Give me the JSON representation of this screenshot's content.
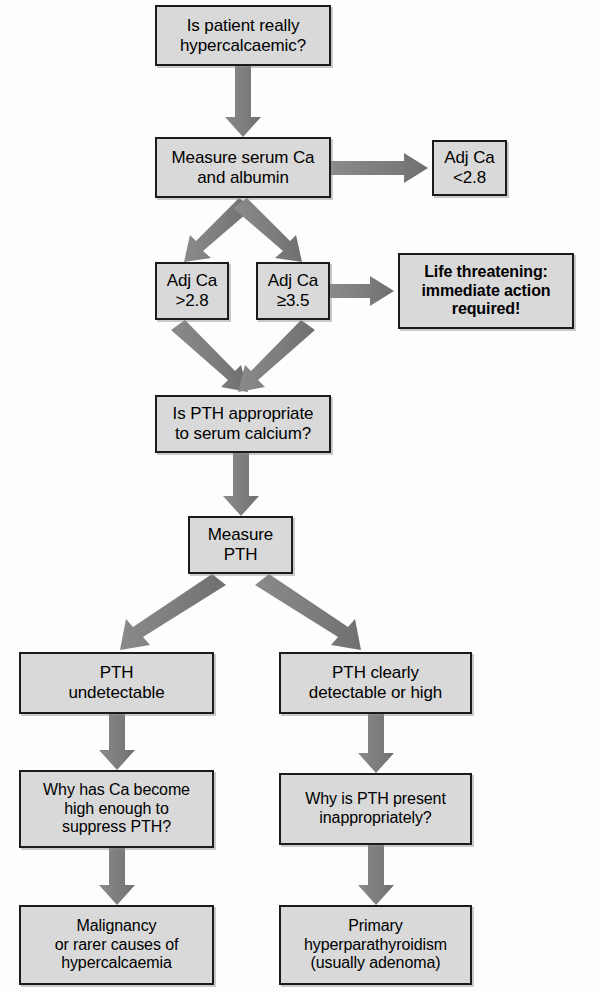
{
  "diagram": {
    "colors": {
      "box_fill": "#d9d9d9",
      "box_border": "#1b1b1b",
      "arrow": "#7d7d7d",
      "text": "#000000",
      "background": "#fdfdfd"
    },
    "nodes": [
      {
        "id": "is-patient-hypercalcaemic",
        "label": "Is patient really\nhypercalcaemic?",
        "bold": false,
        "x": 155,
        "y": 5,
        "w": 176,
        "h": 61,
        "font_size": 17
      },
      {
        "id": "measure-serum-ca-albumin",
        "label": "Measure serum Ca\nand albumin",
        "bold": false,
        "x": 155,
        "y": 137,
        "w": 176,
        "h": 61,
        "font_size": 17
      },
      {
        "id": "adj-ca-lt-2-8",
        "label": "Adj Ca\n<2.8",
        "bold": false,
        "x": 432,
        "y": 140,
        "w": 75,
        "h": 56,
        "font_size": 17
      },
      {
        "id": "adj-ca-gt-2-8",
        "label": "Adj Ca\n>2.8",
        "bold": false,
        "x": 155,
        "y": 262,
        "w": 74,
        "h": 58,
        "font_size": 17
      },
      {
        "id": "adj-ca-gte-3-5",
        "label": "Adj Ca\n≥3.5",
        "bold": false,
        "x": 256,
        "y": 262,
        "w": 74,
        "h": 58,
        "font_size": 17
      },
      {
        "id": "life-threatening",
        "label": "Life threatening:\nimmediate action\nrequired!",
        "bold": true,
        "x": 398,
        "y": 253,
        "w": 176,
        "h": 76,
        "font_size": 16
      },
      {
        "id": "is-pth-appropriate",
        "label": "Is PTH appropriate\nto serum calcium?",
        "bold": false,
        "x": 155,
        "y": 395,
        "w": 176,
        "h": 58,
        "font_size": 17
      },
      {
        "id": "measure-pth",
        "label": "Measure\nPTH",
        "bold": false,
        "x": 188,
        "y": 516,
        "w": 105,
        "h": 58,
        "font_size": 17
      },
      {
        "id": "pth-undetectable",
        "label": "PTH\nundetectable",
        "bold": false,
        "x": 19,
        "y": 652,
        "w": 195,
        "h": 62,
        "font_size": 17
      },
      {
        "id": "pth-detectable-or-high",
        "label": "PTH clearly\ndetectable or high",
        "bold": false,
        "x": 279,
        "y": 652,
        "w": 193,
        "h": 62,
        "font_size": 17
      },
      {
        "id": "why-ca-high-suppress-pth",
        "label": "Why has Ca become\nhigh  enough to\nsuppress PTH?",
        "bold": false,
        "x": 19,
        "y": 770,
        "w": 195,
        "h": 78,
        "font_size": 16
      },
      {
        "id": "why-pth-present-inappropriately",
        "label": "Why is PTH present\ninappropriately?",
        "bold": false,
        "x": 279,
        "y": 773,
        "w": 193,
        "h": 72,
        "font_size": 16
      },
      {
        "id": "malignancy-or-rarer",
        "label": "Malignancy\nor rarer causes of\nhypercalcaemia",
        "bold": false,
        "x": 19,
        "y": 905,
        "w": 195,
        "h": 80,
        "font_size": 16
      },
      {
        "id": "primary-hyperparathyroidism",
        "label": "Primary\nhyperparathyroidism\n(usually adenoma)",
        "bold": false,
        "x": 279,
        "y": 905,
        "w": 193,
        "h": 80,
        "font_size": 16
      }
    ],
    "arrows": [
      {
        "id": "arrow-hypercalcaemic-to-measure",
        "from": "is-patient-hypercalcaemic",
        "to": "measure-serum-ca-albumin",
        "direction": "down"
      },
      {
        "id": "arrow-measure-to-adj-lt",
        "from": "measure-serum-ca-albumin",
        "to": "adj-ca-lt-2-8",
        "direction": "right"
      },
      {
        "id": "arrow-measure-to-adj-gt",
        "from": "measure-serum-ca-albumin",
        "to": "adj-ca-gt-2-8",
        "direction": "down-left"
      },
      {
        "id": "arrow-measure-to-adj-gte",
        "from": "measure-serum-ca-albumin",
        "to": "adj-ca-gte-3-5",
        "direction": "down-right"
      },
      {
        "id": "arrow-adj-gte-to-life-threatening",
        "from": "adj-ca-gte-3-5",
        "to": "life-threatening",
        "direction": "right"
      },
      {
        "id": "arrow-adj-gt-to-is-pth",
        "from": "adj-ca-gt-2-8",
        "to": "is-pth-appropriate",
        "direction": "down-right"
      },
      {
        "id": "arrow-adj-gte-to-is-pth",
        "from": "adj-ca-gte-3-5",
        "to": "is-pth-appropriate",
        "direction": "down-left"
      },
      {
        "id": "arrow-is-pth-to-measure-pth",
        "from": "is-pth-appropriate",
        "to": "measure-pth",
        "direction": "down"
      },
      {
        "id": "arrow-measure-pth-to-undetectable",
        "from": "measure-pth",
        "to": "pth-undetectable",
        "direction": "down-left"
      },
      {
        "id": "arrow-measure-pth-to-detectable",
        "from": "measure-pth",
        "to": "pth-detectable-or-high",
        "direction": "down-right"
      },
      {
        "id": "arrow-undetectable-to-why-ca",
        "from": "pth-undetectable",
        "to": "why-ca-high-suppress-pth",
        "direction": "down"
      },
      {
        "id": "arrow-detectable-to-why-pth",
        "from": "pth-detectable-or-high",
        "to": "why-pth-present-inappropriately",
        "direction": "down"
      },
      {
        "id": "arrow-why-ca-to-malignancy",
        "from": "why-ca-high-suppress-pth",
        "to": "malignancy-or-rarer",
        "direction": "down"
      },
      {
        "id": "arrow-why-pth-to-primary",
        "from": "why-pth-present-inappropriately",
        "to": "primary-hyperparathyroidism",
        "direction": "down"
      }
    ]
  }
}
